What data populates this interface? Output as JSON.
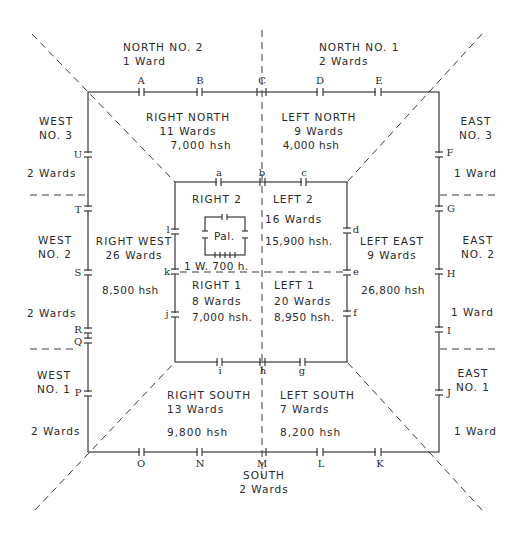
{
  "diagram": {
    "outer_districts": {
      "north_no2": {
        "name": "NORTH NO. 2",
        "wards": "1 Ward"
      },
      "north_no1": {
        "name": "NORTH NO. 1",
        "wards": "2 Wards"
      },
      "west_no3": {
        "name_line1": "WEST",
        "name_line2": "NO. 3",
        "wards": "2 Wards"
      },
      "west_no2": {
        "name_line1": "WEST",
        "name_line2": "NO. 2",
        "wards": "2 Wards"
      },
      "west_no1": {
        "name_line1": "WEST",
        "name_line2": "NO. 1",
        "wards": "2 Wards"
      },
      "east_no3": {
        "name_line1": "EAST",
        "name_line2": "NO. 3",
        "wards": "1 Ward"
      },
      "east_no2": {
        "name_line1": "EAST",
        "name_line2": "NO. 2",
        "wards": "1 Ward"
      },
      "east_no1": {
        "name_line1": "EAST",
        "name_line2": "NO. 1",
        "wards": "1 Ward"
      },
      "south": {
        "name": "SOUTH",
        "wards": "2 Wards"
      }
    },
    "middle_districts": {
      "right_north": {
        "name": "RIGHT NORTH",
        "wards": "11 Wards",
        "households": "7,000 hsh"
      },
      "left_north": {
        "name": "LEFT NORTH",
        "wards": "9 Wards",
        "households": "4,000 hsh"
      },
      "right_west": {
        "name": "RIGHT WEST",
        "wards": "26 Wards",
        "households": "8,500 hsh"
      },
      "left_east": {
        "name": "LEFT EAST",
        "wards": "9 Wards",
        "households": "26,800 hsh"
      },
      "right_south": {
        "name": "RIGHT SOUTH",
        "wards": "13 Wards",
        "households": "9,800 hsh"
      },
      "left_south": {
        "name": "LEFT SOUTH",
        "wards": "7 Wards",
        "households": "8,200 hsh"
      }
    },
    "inner_districts": {
      "right_2": {
        "name": "RIGHT 2",
        "palace": "Pal.",
        "wards_households": "1 W. 700 h."
      },
      "left_2": {
        "name": "LEFT 2",
        "wards": "16 Wards",
        "households": "15,900 hsh."
      },
      "right_1": {
        "name": "RIGHT 1",
        "wards": "8 Wards",
        "households": "7,000 hsh."
      },
      "left_1": {
        "name": "LEFT 1",
        "wards": "20 Wards",
        "households": "8,950 hsh."
      }
    },
    "outer_gates": {
      "north": [
        "A",
        "B",
        "C",
        "D",
        "E"
      ],
      "east": [
        "F",
        "G",
        "H",
        "I",
        "J"
      ],
      "south": [
        "K",
        "L",
        "M",
        "N",
        "O"
      ],
      "west": [
        "P",
        "Q",
        "R",
        "S",
        "T",
        "U"
      ]
    },
    "inner_gates": {
      "north": [
        "a",
        "b",
        "c"
      ],
      "east": [
        "d",
        "e",
        "f"
      ],
      "south": [
        "g",
        "h",
        "i"
      ],
      "west": [
        "j",
        "k",
        "l"
      ]
    }
  }
}
